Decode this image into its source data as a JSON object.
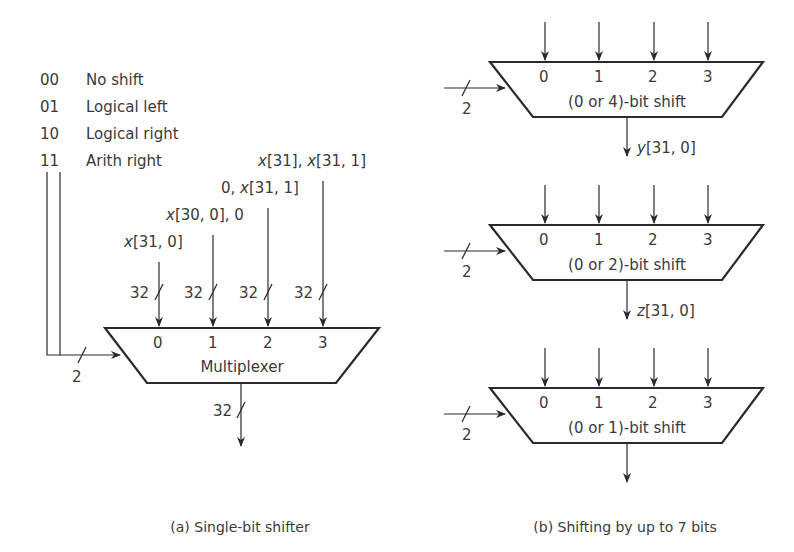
{
  "figure_a": {
    "legend": [
      {
        "code": "00",
        "label": "No shift"
      },
      {
        "code": "01",
        "label": "Logical left"
      },
      {
        "code": "10",
        "label": "Logical right"
      },
      {
        "code": "11",
        "label": "Arith right"
      }
    ],
    "inputs": [
      {
        "prefix": "",
        "var": "x",
        "rest": "[31, 0]",
        "width": "32",
        "port": "0"
      },
      {
        "prefix": "",
        "var": "x",
        "rest": "[30, 0], 0",
        "width": "32",
        "port": "1"
      },
      {
        "prefix": "0, ",
        "var": "x",
        "rest": "[31, 1]",
        "width": "32",
        "port": "2"
      },
      {
        "prefix": "",
        "var": "x",
        "rest": "[31], x[31, 1]",
        "width": "32",
        "port": "3"
      }
    ],
    "mux_label": "Multiplexer",
    "select_width": "2",
    "output_width": "32",
    "caption": "(a) Single-bit shifter"
  },
  "figure_b": {
    "stages": [
      {
        "label": "(0 or 4)-bit shift",
        "ports": [
          "0",
          "1",
          "2",
          "3"
        ],
        "select_width": "2",
        "output_var": "y",
        "output_rest": "[31, 0]"
      },
      {
        "label": "(0 or 2)-bit shift",
        "ports": [
          "0",
          "1",
          "2",
          "3"
        ],
        "select_width": "2",
        "output_var": "z",
        "output_rest": "[31, 0]"
      },
      {
        "label": "(0 or 1)-bit shift",
        "ports": [
          "0",
          "1",
          "2",
          "3"
        ],
        "select_width": "2",
        "output_var": "",
        "output_rest": ""
      }
    ],
    "caption": "(b) Shifting by up to 7 bits"
  }
}
